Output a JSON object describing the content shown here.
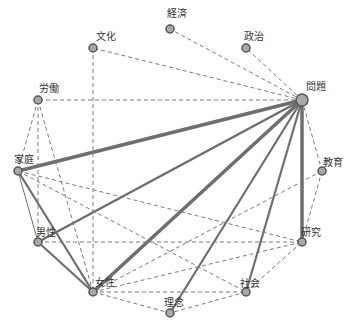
{
  "diagram": {
    "type": "co-occurrence network",
    "colors": {
      "node_fill": "#a8a8a8",
      "node_stroke": "#555555",
      "edge_solid": "#6e6e6e",
      "edge_dashed": "#7a7a7a",
      "label": "#333333"
    },
    "nodes": [
      {
        "id": "keizai",
        "label": "経済",
        "x": 170,
        "y": 29,
        "r": 4,
        "lx": 167,
        "ly": 8
      },
      {
        "id": "bunka",
        "label": "文化",
        "x": 93,
        "y": 48,
        "r": 4,
        "lx": 96,
        "ly": 31
      },
      {
        "id": "seiji",
        "label": "政治",
        "x": 246,
        "y": 48,
        "r": 4,
        "lx": 244,
        "ly": 31
      },
      {
        "id": "mondai",
        "label": "問題",
        "x": 302,
        "y": 100,
        "r": 6,
        "lx": 306,
        "ly": 81
      },
      {
        "id": "roudou",
        "label": "労働",
        "x": 38,
        "y": 100,
        "r": 4,
        "lx": 39,
        "ly": 83
      },
      {
        "id": "katei",
        "label": "家庭",
        "x": 18,
        "y": 171,
        "r": 4,
        "lx": 14,
        "ly": 154
      },
      {
        "id": "kyouiku",
        "label": "教育",
        "x": 322,
        "y": 171,
        "r": 4,
        "lx": 323,
        "ly": 157
      },
      {
        "id": "dansei",
        "label": "男性",
        "x": 38,
        "y": 242,
        "r": 4,
        "lx": 36,
        "ly": 227
      },
      {
        "id": "kenkyuu",
        "label": "研究",
        "x": 302,
        "y": 242,
        "r": 4,
        "lx": 301,
        "ly": 227
      },
      {
        "id": "josei",
        "label": "女性",
        "x": 93,
        "y": 292,
        "r": 4,
        "lx": 95,
        "ly": 277
      },
      {
        "id": "shakai",
        "label": "社会",
        "x": 246,
        "y": 292,
        "r": 4,
        "lx": 240,
        "ly": 278
      },
      {
        "id": "rinen",
        "label": "理念",
        "x": 170,
        "y": 313,
        "r": 4,
        "lx": 164,
        "ly": 297
      }
    ],
    "edges": [
      {
        "from": "mondai",
        "to": "katei",
        "style": "solid",
        "width": 3.5
      },
      {
        "from": "mondai",
        "to": "dansei",
        "style": "solid",
        "width": 2.5
      },
      {
        "from": "mondai",
        "to": "josei",
        "style": "solid",
        "width": 3.5
      },
      {
        "from": "mondai",
        "to": "rinen",
        "style": "solid",
        "width": 2.2
      },
      {
        "from": "mondai",
        "to": "shakai",
        "style": "solid",
        "width": 2.2
      },
      {
        "from": "mondai",
        "to": "kenkyuu",
        "style": "solid",
        "width": 3.5
      },
      {
        "from": "mondai",
        "to": "keizai",
        "style": "dashed",
        "width": 1
      },
      {
        "from": "mondai",
        "to": "seiji",
        "style": "dashed",
        "width": 1
      },
      {
        "from": "mondai",
        "to": "bunka",
        "style": "dashed",
        "width": 1
      },
      {
        "from": "mondai",
        "to": "roudou",
        "style": "dashed",
        "width": 1
      },
      {
        "from": "mondai",
        "to": "kyouiku",
        "style": "dashed",
        "width": 1
      },
      {
        "from": "bunka",
        "to": "josei",
        "style": "dashed",
        "width": 1
      },
      {
        "from": "roudou",
        "to": "katei",
        "style": "dashed",
        "width": 1
      },
      {
        "from": "roudou",
        "to": "dansei",
        "style": "dashed",
        "width": 1
      },
      {
        "from": "roudou",
        "to": "josei",
        "style": "dashed",
        "width": 1
      },
      {
        "from": "katei",
        "to": "dansei",
        "style": "solid",
        "width": 1
      },
      {
        "from": "katei",
        "to": "josei",
        "style": "solid",
        "width": 2.2
      },
      {
        "from": "katei",
        "to": "kenkyuu",
        "style": "dashed",
        "width": 1
      },
      {
        "from": "katei",
        "to": "shakai",
        "style": "dashed",
        "width": 1
      },
      {
        "from": "dansei",
        "to": "josei",
        "style": "solid",
        "width": 2.2
      },
      {
        "from": "dansei",
        "to": "kenkyuu",
        "style": "dashed",
        "width": 1
      },
      {
        "from": "kyouiku",
        "to": "kenkyuu",
        "style": "dashed",
        "width": 1
      },
      {
        "from": "kyouiku",
        "to": "josei",
        "style": "dashed",
        "width": 1
      },
      {
        "from": "josei",
        "to": "kenkyuu",
        "style": "dashed",
        "width": 1
      },
      {
        "from": "josei",
        "to": "shakai",
        "style": "dashed",
        "width": 1
      },
      {
        "from": "josei",
        "to": "rinen",
        "style": "dashed",
        "width": 1
      },
      {
        "from": "shakai",
        "to": "kenkyuu",
        "style": "dashed",
        "width": 1
      },
      {
        "from": "shakai",
        "to": "rinen",
        "style": "dashed",
        "width": 1
      }
    ]
  }
}
